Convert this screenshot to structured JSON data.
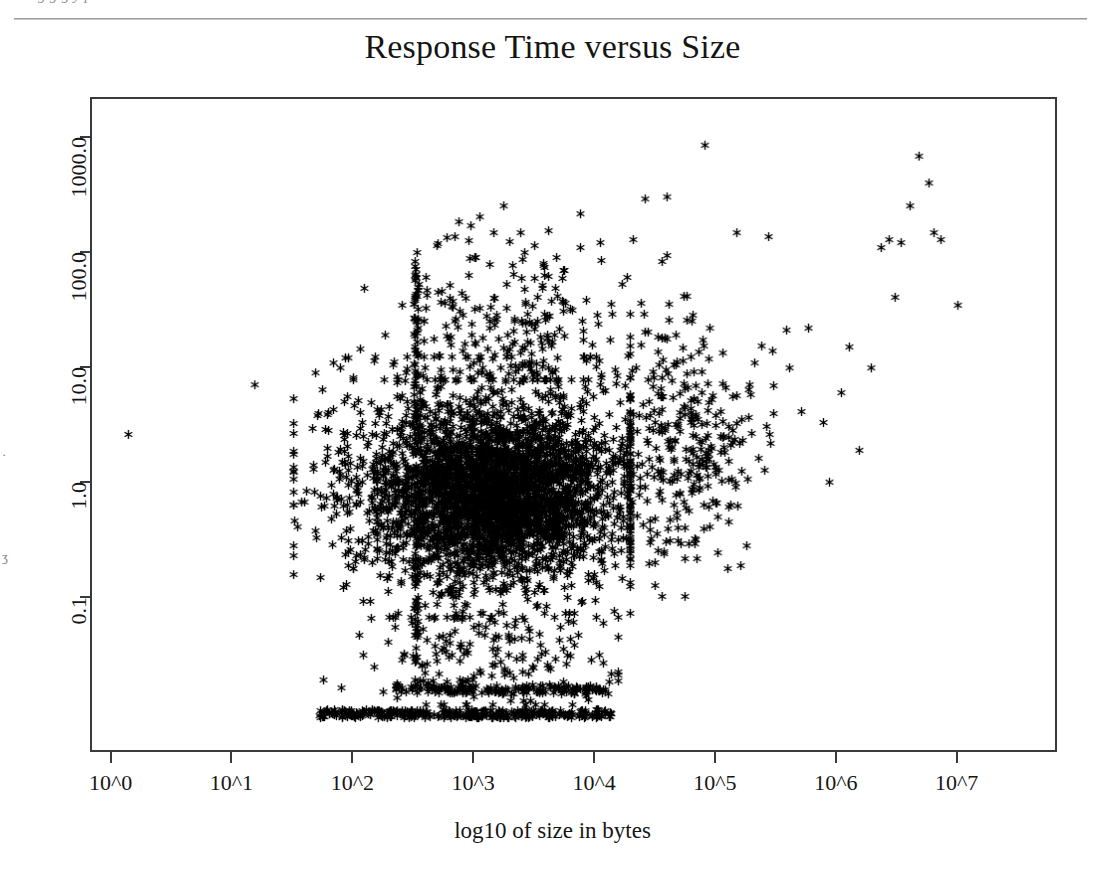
{
  "page": {
    "artifact_top_text": "g        g  g   y   p",
    "margin_fragments": [
      "·",
      "ʒ"
    ]
  },
  "chart_data": {
    "type": "scatter",
    "title": "Response Time versus Size",
    "xlabel": "log10 of size in bytes",
    "ylabel": "",
    "grid": false,
    "legend": null,
    "marker": "asterisk",
    "marker_color": "#000000",
    "marker_size_px": 9,
    "x_scale": "log10-exponent",
    "y_scale": "log10",
    "xlim": [
      -0.17,
      7.83
    ],
    "ylim": [
      -2.35,
      3.35
    ],
    "x_ticks": [
      0,
      1,
      2,
      3,
      4,
      5,
      6,
      7
    ],
    "x_tick_labels": [
      "10^0",
      "10^1",
      "10^2",
      "10^3",
      "10^4",
      "10^5",
      "10^6",
      "10^7"
    ],
    "y_ticks": [
      1000.0,
      100.0,
      10.0,
      1.0,
      0.1
    ],
    "y_tick_labels": [
      "1000.0",
      "100.0",
      "10.0",
      "1.0",
      "0.1"
    ],
    "n_points_approx": 4200,
    "clusters": [
      {
        "name": "isolated-small-objects",
        "kind": "points",
        "points": [
          [
            0.13,
            0.42
          ],
          [
            1.18,
            0.85
          ]
        ]
      },
      {
        "name": "main-cloud",
        "kind": "blob",
        "x_range": [
          1.5,
          4.3
        ],
        "y_log_range": [
          -1.15,
          1.1
        ],
        "x_center": 3.1,
        "y_log_center": -0.05,
        "x_sigma": 0.62,
        "y_log_sigma": 0.46,
        "count": 2100
      },
      {
        "name": "main-cloud-core",
        "kind": "blob",
        "x_range": [
          2.2,
          4.25
        ],
        "y_log_range": [
          -0.95,
          0.6
        ],
        "x_center": 3.2,
        "y_log_center": -0.12,
        "x_sigma": 0.42,
        "y_log_sigma": 0.3,
        "count": 1450
      },
      {
        "name": "upper-scatter",
        "kind": "blob",
        "x_range": [
          2.0,
          4.6
        ],
        "y_log_range": [
          0.9,
          2.55
        ],
        "x_center": 3.35,
        "y_log_center": 1.35,
        "x_sigma": 0.55,
        "y_log_sigma": 0.42,
        "count": 240
      },
      {
        "name": "vertical-spike-1e2.5",
        "kind": "vline",
        "x": 2.52,
        "y_log_range": [
          -1.6,
          1.95
        ],
        "count": 120
      },
      {
        "name": "floor-band",
        "kind": "hline",
        "y_log": -2.03,
        "x_range": [
          1.72,
          4.15
        ],
        "count": 330
      },
      {
        "name": "floor-band-upper",
        "kind": "hline",
        "y_log": -1.82,
        "x_range": [
          2.35,
          4.12
        ],
        "count": 150
      },
      {
        "name": "low-tail",
        "kind": "blob",
        "x_range": [
          1.75,
          4.2
        ],
        "y_log_range": [
          -1.95,
          -1.18
        ],
        "x_center": 3.15,
        "y_log_center": -1.55,
        "x_sigma": 0.55,
        "y_log_sigma": 0.25,
        "count": 190
      },
      {
        "name": "large-object-tail",
        "kind": "blob",
        "x_range": [
          4.3,
          5.6
        ],
        "y_log_range": [
          -1.0,
          1.9
        ],
        "x_center": 4.72,
        "y_log_center": 0.32,
        "x_sigma": 0.32,
        "y_log_sigma": 0.52,
        "count": 330
      },
      {
        "name": "far-right-tail",
        "kind": "points",
        "points": [
          [
            5.62,
            1.0
          ],
          [
            5.72,
            0.62
          ],
          [
            5.78,
            1.35
          ],
          [
            5.9,
            0.52
          ],
          [
            5.95,
            0.0
          ],
          [
            6.05,
            0.78
          ],
          [
            6.12,
            1.18
          ],
          [
            6.2,
            0.28
          ],
          [
            6.3,
            1.0
          ],
          [
            6.38,
            2.05
          ],
          [
            6.45,
            2.12
          ],
          [
            6.5,
            1.62
          ],
          [
            6.55,
            2.1
          ],
          [
            6.62,
            2.42
          ],
          [
            6.7,
            2.85
          ],
          [
            6.78,
            2.62
          ],
          [
            6.82,
            2.18
          ],
          [
            6.88,
            2.12
          ],
          [
            7.02,
            1.55
          ],
          [
            5.45,
            2.15
          ],
          [
            5.18,
            2.18
          ],
          [
            4.92,
            2.95
          ],
          [
            4.6,
            2.5
          ],
          [
            4.42,
            2.48
          ],
          [
            4.32,
            2.12
          ],
          [
            4.05,
            2.1
          ],
          [
            3.88,
            2.35
          ],
          [
            3.62,
            2.2
          ],
          [
            3.4,
            1.95
          ],
          [
            3.25,
            2.42
          ]
        ]
      }
    ]
  }
}
